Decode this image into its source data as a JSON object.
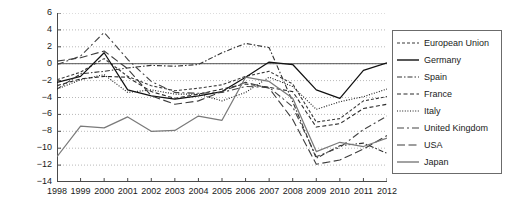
{
  "chart_data": {
    "type": "line",
    "title": "",
    "xlabel": "",
    "ylabel": "",
    "x": [
      1998,
      1999,
      2000,
      2001,
      2002,
      2003,
      2004,
      2005,
      2006,
      2007,
      2008,
      2009,
      2010,
      2011,
      2012
    ],
    "xtick_labels": [
      "1998",
      "1999",
      "2000",
      "2001",
      "2002",
      "2003",
      "2004",
      "2005",
      "2006",
      "2007",
      "2008",
      "2009",
      "2010",
      "2011",
      "2012"
    ],
    "ytick_labels": [
      "6",
      "4",
      "2",
      "0",
      "-2",
      "-4",
      "-6",
      "-8",
      "-10",
      "-12",
      "-14"
    ],
    "ytick_values": [
      6,
      4,
      2,
      0,
      -2,
      -4,
      -6,
      -8,
      -10,
      -12,
      -14
    ],
    "ylim": [
      -14,
      6
    ],
    "xlim": [
      1998,
      2012
    ],
    "grid": true,
    "grid_style": "dotted-horizontal",
    "zero_line": true,
    "legend_position": "right-outside",
    "series": [
      {
        "name": "European Union",
        "line_style": "dashed-short",
        "color": "#3a3a3a",
        "values": [
          -1.9,
          -1.0,
          0.6,
          -1.5,
          -2.6,
          -3.2,
          -2.9,
          -2.5,
          -1.5,
          -0.9,
          -2.4,
          -6.9,
          -6.5,
          -4.4,
          -3.9
        ]
      },
      {
        "name": "Germany",
        "line_style": "solid",
        "color": "#111111",
        "values": [
          -2.2,
          -1.5,
          1.3,
          -3.1,
          -3.8,
          -4.2,
          -3.8,
          -3.3,
          -1.6,
          0.2,
          -0.1,
          -3.1,
          -4.1,
          -0.8,
          0.1
        ]
      },
      {
        "name": "Spain",
        "line_style": "dash-dot",
        "color": "#333333",
        "values": [
          -3.0,
          -1.2,
          -0.9,
          -0.5,
          -0.2,
          -0.3,
          -0.1,
          1.3,
          2.4,
          1.9,
          -4.5,
          -11.2,
          -9.7,
          -9.4,
          -10.6
        ]
      },
      {
        "name": "France",
        "line_style": "dashed-medium",
        "color": "#2b2b2b",
        "values": [
          -2.6,
          -1.8,
          -1.5,
          -1.6,
          -3.3,
          -4.1,
          -3.6,
          -3.0,
          -2.4,
          -2.8,
          -3.3,
          -7.5,
          -7.1,
          -5.3,
          -4.8
        ]
      },
      {
        "name": "Italy",
        "line_style": "dotted",
        "color": "#1a1a1a",
        "values": [
          -3.0,
          -1.9,
          -1.3,
          -3.4,
          -3.1,
          -3.6,
          -3.6,
          -4.4,
          -3.4,
          -1.6,
          -2.7,
          -5.4,
          -4.5,
          -3.9,
          -3.0
        ]
      },
      {
        "name": "United Kingdom",
        "line_style": "long-dash-gap",
        "color": "#444444",
        "values": [
          -0.1,
          0.9,
          3.7,
          0.5,
          -2.1,
          -3.4,
          -3.5,
          -3.4,
          -2.7,
          -2.8,
          -5.1,
          -11.0,
          -9.9,
          -7.8,
          -6.2
        ]
      },
      {
        "name": "USA",
        "line_style": "long-dash",
        "color": "#3d3d3d",
        "values": [
          0.3,
          0.7,
          1.5,
          -0.6,
          -3.8,
          -4.8,
          -4.4,
          -3.3,
          -2.2,
          -2.9,
          -6.6,
          -11.9,
          -11.4,
          -10.1,
          -8.5
        ]
      },
      {
        "name": "Japan",
        "line_style": "solid-gray",
        "color": "#7a7a7a",
        "values": [
          -11.0,
          -7.4,
          -7.6,
          -6.3,
          -8.0,
          -7.9,
          -6.2,
          -6.7,
          -1.6,
          -2.1,
          -4.1,
          -10.4,
          -9.3,
          -9.8,
          -8.8
        ]
      }
    ]
  }
}
